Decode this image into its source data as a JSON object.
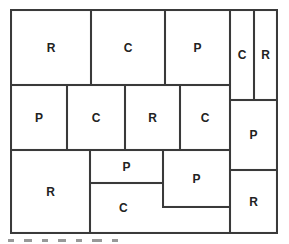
{
  "diagram": {
    "type": "rectangle-partition",
    "cells": [
      {
        "id": "r1c1",
        "label": "R"
      },
      {
        "id": "r1c2",
        "label": "C"
      },
      {
        "id": "r1c3",
        "label": "P"
      },
      {
        "id": "r1c4",
        "label": "C"
      },
      {
        "id": "r1c5",
        "label": "R"
      },
      {
        "id": "r2c1",
        "label": "P"
      },
      {
        "id": "r2c2",
        "label": "C"
      },
      {
        "id": "r2c3",
        "label": "R"
      },
      {
        "id": "r2c4",
        "label": "C"
      },
      {
        "id": "r2c5",
        "label": "P"
      },
      {
        "id": "r3c1",
        "label": "R"
      },
      {
        "id": "r3c2",
        "label": "P"
      },
      {
        "id": "r3c3",
        "label": "C"
      },
      {
        "id": "r3c4",
        "label": "P"
      },
      {
        "id": "r3c5",
        "label": "R"
      }
    ]
  }
}
